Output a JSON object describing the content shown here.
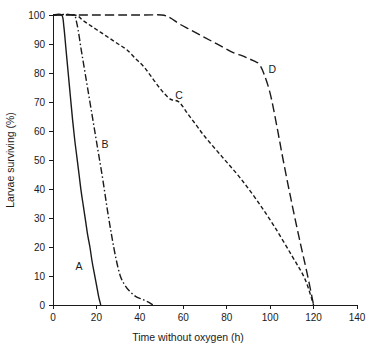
{
  "chart_data": {
    "type": "line",
    "title": "",
    "xlabel": "Time without oxygen (h)",
    "ylabel": "Larvae surviving (%)",
    "xlim": [
      0,
      140
    ],
    "ylim": [
      0,
      100
    ],
    "xticks": [
      0,
      20,
      40,
      60,
      80,
      100,
      120,
      140
    ],
    "yticks": [
      0,
      10,
      20,
      30,
      40,
      50,
      60,
      70,
      80,
      90,
      100
    ],
    "grid": false,
    "legend": "inline-curve-labels",
    "line_color": "#1a1a1a",
    "background": "#ffffff",
    "series": [
      {
        "name": "A",
        "label": "A",
        "linestyle": "solid",
        "dasharray": "none",
        "label_x": 12,
        "label_y": 12,
        "x": [
          0,
          4,
          5,
          6,
          7,
          8,
          9,
          10,
          11,
          12,
          13,
          14,
          15,
          16,
          17,
          18,
          19,
          20,
          21,
          22
        ],
        "y": [
          100,
          100,
          96,
          88,
          80,
          72,
          64,
          57,
          51,
          45,
          39,
          34,
          29,
          24,
          20,
          15,
          11,
          7,
          3,
          0
        ]
      },
      {
        "name": "B",
        "label": "B",
        "linestyle": "dash-dot",
        "dasharray": "7,2.5,1.5,2.5",
        "label_x": 24,
        "label_y": 54,
        "x": [
          0,
          9,
          11,
          13,
          15,
          17,
          19,
          21,
          23,
          25,
          27,
          29,
          31,
          33,
          35,
          38,
          41,
          44,
          46
        ],
        "y": [
          100,
          100,
          97,
          88,
          79,
          70,
          61,
          52,
          43,
          33,
          24,
          16,
          10,
          7,
          5,
          3,
          2,
          1,
          0
        ]
      },
      {
        "name": "C",
        "label": "C",
        "linestyle": "short-dash",
        "dasharray": "4,2.5",
        "label_x": 58,
        "label_y": 71,
        "x": [
          0,
          10,
          14,
          18,
          22,
          26,
          30,
          34,
          38,
          42,
          46,
          50,
          54,
          58,
          62,
          66,
          70,
          78,
          86,
          94,
          102,
          110,
          116,
          120
        ],
        "y": [
          100,
          100,
          98,
          96,
          94,
          92,
          90,
          88,
          85,
          82,
          78,
          74,
          71,
          70,
          66,
          62,
          58,
          51,
          44,
          36,
          27,
          17,
          9,
          0
        ]
      },
      {
        "name": "D",
        "label": "D",
        "linestyle": "long-dash",
        "dasharray": "9,4",
        "label_x": 101,
        "label_y": 80,
        "x": [
          0,
          11,
          40,
          50,
          54,
          58,
          63,
          68,
          73,
          78,
          83,
          87,
          90,
          93,
          95,
          97,
          100,
          103,
          106,
          110,
          114,
          117,
          120
        ],
        "y": [
          100,
          100,
          100,
          100,
          99,
          97,
          95,
          93,
          91,
          89,
          87,
          86,
          85,
          84,
          83,
          80,
          73,
          62,
          50,
          35,
          21,
          11,
          0
        ]
      }
    ]
  },
  "axes": {
    "x_title": "Time without oxygen (h)",
    "y_title": "Larvae surviving (%)",
    "x_tick_labels": [
      "0",
      "20",
      "40",
      "60",
      "80",
      "100",
      "120",
      "140"
    ],
    "y_tick_labels": [
      "0",
      "10",
      "20",
      "30",
      "40",
      "50",
      "60",
      "70",
      "80",
      "90",
      "100"
    ]
  },
  "curve_labels": {
    "a": "A",
    "b": "B",
    "c": "C",
    "d": "D"
  }
}
